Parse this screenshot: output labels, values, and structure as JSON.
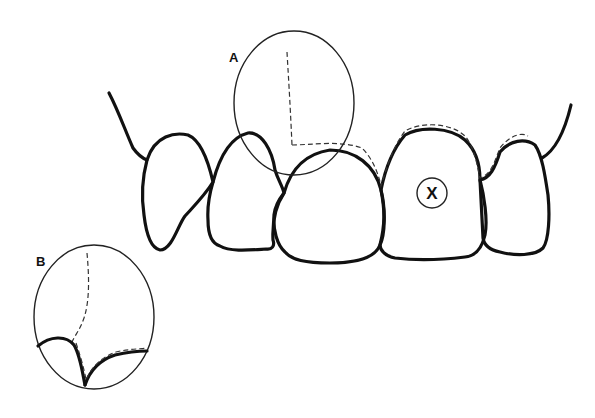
{
  "figure": {
    "type": "dental diagram",
    "labels": {
      "inset_a": "A",
      "inset_b": "B",
      "marked_tooth": "X"
    },
    "elements": [
      {
        "name": "gingival-margin-line",
        "style": "thick"
      },
      {
        "name": "tooth-1",
        "style": "thick"
      },
      {
        "name": "tooth-2",
        "style": "thick"
      },
      {
        "name": "tooth-3",
        "style": "thick"
      },
      {
        "name": "tooth-4-marked-x",
        "style": "thick"
      },
      {
        "name": "tooth-5",
        "style": "thick"
      },
      {
        "name": "inset-circle-a",
        "style": "thin"
      },
      {
        "name": "inset-circle-b",
        "style": "thin"
      },
      {
        "name": "dashed-margin-line",
        "style": "dashed"
      }
    ]
  }
}
